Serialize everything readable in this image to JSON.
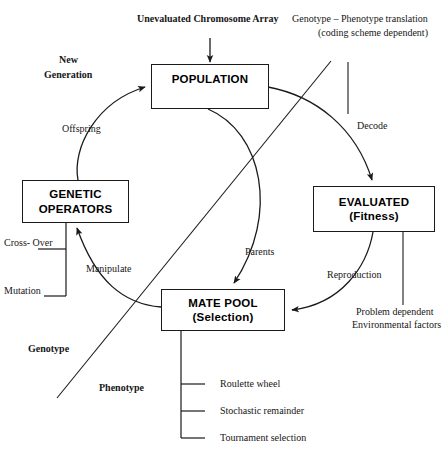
{
  "diagram": {
    "stroke_color": "#1a1a1a",
    "background_color": "#ffffff",
    "nodes": [
      {
        "id": "population",
        "line1": "POPULATION",
        "line2": ""
      },
      {
        "id": "genetic_operators",
        "line1": "GENETIC",
        "line2": "OPERATORS"
      },
      {
        "id": "evaluated",
        "line1": "EVALUATED",
        "line2": "(Fitness)"
      },
      {
        "id": "mate_pool",
        "line1": "MATE POOL",
        "line2": "(Selection)"
      }
    ],
    "annotations": {
      "unevaluated_chromosome_array": "Unevaluated Chromosome Array",
      "genotype_phenotype_line1": "Genotype – Phenotype translation",
      "genotype_phenotype_line2": "(coding scheme dependent)",
      "new_generation_line1": "New",
      "new_generation_line2": "Generation",
      "offspring": "Offspring",
      "decode": "Decode",
      "parents": "Parents",
      "reproduction": "Reproduction",
      "manipulate": "Manipulate",
      "cross_over": "Cross- Over",
      "mutation": "Mutation",
      "genotype": "Genotype",
      "phenotype": "Phenotype",
      "problem_dependent_line1": "Problem dependent",
      "problem_dependent_line2": "Environmental factors"
    },
    "selection_methods": [
      "Roulette wheel",
      "Stochastic remainder",
      "Tournament selection"
    ],
    "operator_methods": [
      "Cross- Over",
      "Mutation"
    ]
  }
}
